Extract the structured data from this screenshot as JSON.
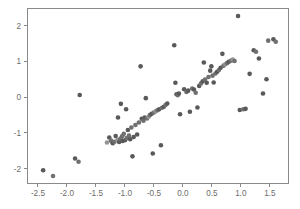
{
  "chart_data": {
    "type": "scatter",
    "title": "",
    "subtitle": "",
    "xlabel": "",
    "ylabel": "",
    "xlim": [
      -2.68,
      1.82
    ],
    "ylim": [
      -2.42,
      2.48
    ],
    "xticks": [
      -2.5,
      -2.0,
      -1.5,
      -1.0,
      -0.5,
      0.0,
      0.5,
      1.0,
      1.5
    ],
    "xticklabels": [
      "-2.5",
      "-2.0",
      "-1.5",
      "-1.0",
      "-0.5",
      "0.0",
      "0.5",
      "1.0",
      "1.5"
    ],
    "yticks": [
      2,
      1,
      0,
      -1,
      -2
    ],
    "yticklabels": [
      "2",
      "1",
      "0",
      "-1",
      "-2"
    ],
    "grid": false,
    "legend": false,
    "legend_position": "none",
    "marker": "circle",
    "marker_size": 4.6,
    "colors": {
      "marker_dark": "#595959",
      "marker_mid": "#707070",
      "marker_light": "#949494",
      "axis": "#8a8a8a",
      "tick_text": "#6d6d6d",
      "background": "#ffffff"
    },
    "n_points": 97,
    "points": [
      {
        "x": -2.41,
        "y": -2.05,
        "shade": "dark"
      },
      {
        "x": -2.24,
        "y": -2.21,
        "shade": "mid"
      },
      {
        "x": -1.86,
        "y": -1.72,
        "shade": "dark"
      },
      {
        "x": -1.8,
        "y": -1.81,
        "shade": "mid"
      },
      {
        "x": -1.78,
        "y": 0.06,
        "shade": "dark"
      },
      {
        "x": -1.31,
        "y": -1.27,
        "shade": "light"
      },
      {
        "x": -1.27,
        "y": -1.13,
        "shade": "dark"
      },
      {
        "x": -1.24,
        "y": -1.22,
        "shade": "mid"
      },
      {
        "x": -1.21,
        "y": -1.29,
        "shade": "dark"
      },
      {
        "x": -1.18,
        "y": -1.25,
        "shade": "mid"
      },
      {
        "x": -1.16,
        "y": -1.09,
        "shade": "dark"
      },
      {
        "x": -1.13,
        "y": -1.2,
        "shade": "light"
      },
      {
        "x": -1.12,
        "y": -0.57,
        "shade": "dark"
      },
      {
        "x": -1.1,
        "y": -1.26,
        "shade": "dark"
      },
      {
        "x": -1.08,
        "y": -1.17,
        "shade": "mid"
      },
      {
        "x": -1.07,
        "y": -0.19,
        "shade": "dark"
      },
      {
        "x": -1.05,
        "y": -1.1,
        "shade": "mid"
      },
      {
        "x": -1.04,
        "y": -1.23,
        "shade": "dark"
      },
      {
        "x": -1.02,
        "y": -1.03,
        "shade": "mid"
      },
      {
        "x": -1.0,
        "y": -1.21,
        "shade": "dark"
      },
      {
        "x": -0.98,
        "y": -0.34,
        "shade": "dark"
      },
      {
        "x": -0.97,
        "y": -1.15,
        "shade": "mid"
      },
      {
        "x": -0.95,
        "y": -0.92,
        "shade": "dark"
      },
      {
        "x": -0.93,
        "y": -1.08,
        "shade": "mid"
      },
      {
        "x": -0.91,
        "y": -1.18,
        "shade": "dark"
      },
      {
        "x": -0.89,
        "y": -0.85,
        "shade": "mid"
      },
      {
        "x": -0.87,
        "y": -1.66,
        "shade": "dark"
      },
      {
        "x": -0.85,
        "y": -1.12,
        "shade": "dark"
      },
      {
        "x": -0.82,
        "y": -0.78,
        "shade": "mid"
      },
      {
        "x": -0.79,
        "y": -1.05,
        "shade": "dark"
      },
      {
        "x": -0.76,
        "y": -0.71,
        "shade": "mid"
      },
      {
        "x": -0.73,
        "y": 0.86,
        "shade": "dark"
      },
      {
        "x": -0.71,
        "y": -0.61,
        "shade": "dark"
      },
      {
        "x": -0.68,
        "y": -0.66,
        "shade": "mid"
      },
      {
        "x": -0.66,
        "y": -0.57,
        "shade": "dark"
      },
      {
        "x": -0.64,
        "y": -0.03,
        "shade": "dark"
      },
      {
        "x": -0.62,
        "y": -0.6,
        "shade": "mid"
      },
      {
        "x": -0.59,
        "y": -0.55,
        "shade": "light"
      },
      {
        "x": -0.57,
        "y": -0.5,
        "shade": "mid"
      },
      {
        "x": -0.54,
        "y": -0.47,
        "shade": "dark"
      },
      {
        "x": -0.52,
        "y": -1.58,
        "shade": "dark"
      },
      {
        "x": -0.5,
        "y": -0.43,
        "shade": "mid"
      },
      {
        "x": -0.47,
        "y": -0.4,
        "shade": "light"
      },
      {
        "x": -0.44,
        "y": -0.37,
        "shade": "mid"
      },
      {
        "x": -0.41,
        "y": -0.34,
        "shade": "dark"
      },
      {
        "x": -0.38,
        "y": -1.35,
        "shade": "dark"
      },
      {
        "x": -0.36,
        "y": -0.3,
        "shade": "mid"
      },
      {
        "x": -0.33,
        "y": -0.27,
        "shade": "dark"
      },
      {
        "x": -0.3,
        "y": -0.22,
        "shade": "mid"
      },
      {
        "x": -0.27,
        "y": -0.18,
        "shade": "dark"
      },
      {
        "x": -0.15,
        "y": 1.45,
        "shade": "dark"
      },
      {
        "x": -0.13,
        "y": 0.4,
        "shade": "dark"
      },
      {
        "x": -0.11,
        "y": 0.08,
        "shade": "dark"
      },
      {
        "x": -0.09,
        "y": 0.05,
        "shade": "mid"
      },
      {
        "x": -0.07,
        "y": 0.1,
        "shade": "dark"
      },
      {
        "x": -0.05,
        "y": -0.48,
        "shade": "dark"
      },
      {
        "x": 0.02,
        "y": 0.22,
        "shade": "dark"
      },
      {
        "x": 0.06,
        "y": 0.14,
        "shade": "mid"
      },
      {
        "x": 0.09,
        "y": 0.18,
        "shade": "dark"
      },
      {
        "x": 0.12,
        "y": -0.41,
        "shade": "dark"
      },
      {
        "x": 0.16,
        "y": 0.24,
        "shade": "mid"
      },
      {
        "x": 0.19,
        "y": 0.21,
        "shade": "dark"
      },
      {
        "x": 0.22,
        "y": 0.12,
        "shade": "mid"
      },
      {
        "x": 0.25,
        "y": -0.29,
        "shade": "dark"
      },
      {
        "x": 0.28,
        "y": 0.31,
        "shade": "dark"
      },
      {
        "x": 0.31,
        "y": 0.38,
        "shade": "mid"
      },
      {
        "x": 0.34,
        "y": 0.44,
        "shade": "dark"
      },
      {
        "x": 0.36,
        "y": 0.97,
        "shade": "dark"
      },
      {
        "x": 0.38,
        "y": 0.49,
        "shade": "mid"
      },
      {
        "x": 0.41,
        "y": 0.4,
        "shade": "dark"
      },
      {
        "x": 0.44,
        "y": 0.56,
        "shade": "mid"
      },
      {
        "x": 0.47,
        "y": 0.74,
        "shade": "dark"
      },
      {
        "x": 0.49,
        "y": 0.86,
        "shade": "dark"
      },
      {
        "x": 0.51,
        "y": 0.6,
        "shade": "mid"
      },
      {
        "x": 0.53,
        "y": 0.41,
        "shade": "dark"
      },
      {
        "x": 0.56,
        "y": 0.66,
        "shade": "mid"
      },
      {
        "x": 0.59,
        "y": 0.71,
        "shade": "dark"
      },
      {
        "x": 0.62,
        "y": 0.76,
        "shade": "mid"
      },
      {
        "x": 0.65,
        "y": 0.82,
        "shade": "dark"
      },
      {
        "x": 0.68,
        "y": 1.21,
        "shade": "dark"
      },
      {
        "x": 0.7,
        "y": 0.88,
        "shade": "mid"
      },
      {
        "x": 0.73,
        "y": 0.92,
        "shade": "light"
      },
      {
        "x": 0.76,
        "y": 0.95,
        "shade": "mid"
      },
      {
        "x": 0.79,
        "y": 0.99,
        "shade": "dark"
      },
      {
        "x": 0.83,
        "y": 1.02,
        "shade": "mid"
      },
      {
        "x": 0.86,
        "y": 1.05,
        "shade": "light"
      },
      {
        "x": 0.89,
        "y": 1.01,
        "shade": "mid"
      },
      {
        "x": 0.95,
        "y": 2.27,
        "shade": "dark"
      },
      {
        "x": 0.98,
        "y": -0.36,
        "shade": "dark"
      },
      {
        "x": 1.04,
        "y": -0.34,
        "shade": "mid"
      },
      {
        "x": 1.08,
        "y": -0.33,
        "shade": "dark"
      },
      {
        "x": 1.15,
        "y": 0.65,
        "shade": "dark"
      },
      {
        "x": 1.22,
        "y": 1.31,
        "shade": "dark"
      },
      {
        "x": 1.26,
        "y": 1.27,
        "shade": "mid"
      },
      {
        "x": 1.31,
        "y": 1.08,
        "shade": "dark"
      },
      {
        "x": 1.38,
        "y": 0.1,
        "shade": "dark"
      },
      {
        "x": 1.44,
        "y": 0.5,
        "shade": "dark"
      },
      {
        "x": 1.47,
        "y": 1.58,
        "shade": "mid"
      },
      {
        "x": 1.56,
        "y": 1.62,
        "shade": "dark"
      },
      {
        "x": 1.6,
        "y": 1.55,
        "shade": "mid"
      }
    ]
  }
}
